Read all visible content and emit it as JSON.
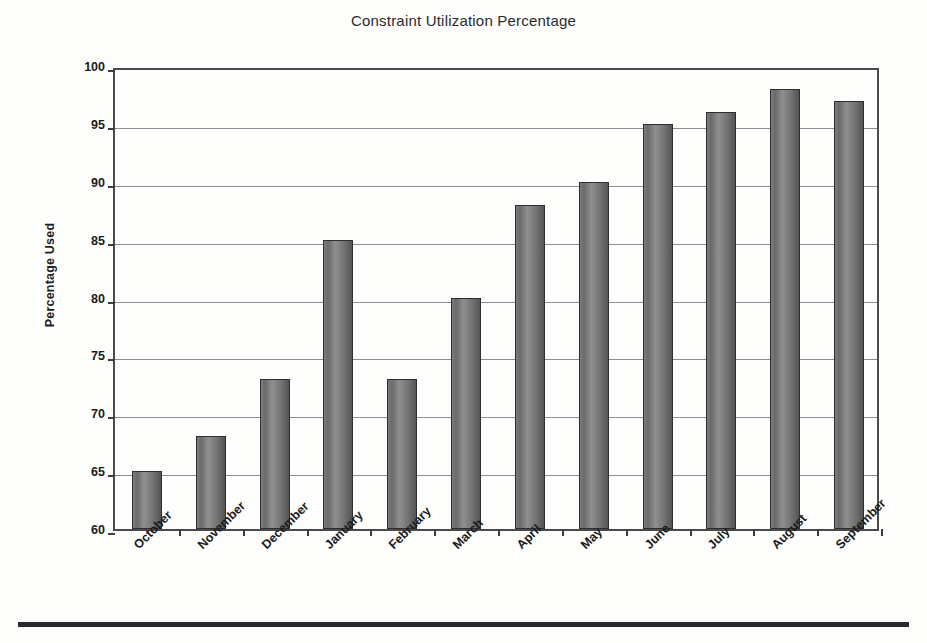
{
  "chart_data": {
    "type": "bar",
    "title": "Constraint Utilization Percentage",
    "xlabel": "",
    "ylabel": "Percentage Used",
    "categories": [
      "October",
      "November",
      "December",
      "January",
      "February",
      "March",
      "April",
      "May",
      "June",
      "July",
      "August",
      "September"
    ],
    "values": [
      65,
      68,
      73,
      85,
      73,
      80,
      88,
      90,
      95,
      96,
      98,
      97
    ],
    "ylim": [
      60,
      100
    ],
    "yticks": [
      60,
      65,
      70,
      75,
      80,
      85,
      90,
      95,
      100
    ],
    "ytick_labels": [
      "60",
      "65",
      "70",
      "75",
      "80",
      "85",
      "90",
      "95",
      "100"
    ],
    "grid": true,
    "legend": false,
    "legend_position": "none",
    "series": [
      {
        "name": "Percentage Used",
        "values": [
          65,
          68,
          73,
          85,
          73,
          80,
          88,
          90,
          95,
          96,
          98,
          97
        ]
      }
    ],
    "colors": {
      "bar_fill_light": "#8f8f8f",
      "bar_fill_dark": "#545454",
      "bar_outline": "#2e2e2e",
      "gridline": "#8d8d8d",
      "axis": "#4a4a4a",
      "text": "#1b1b1b",
      "background": "#fdfdfc"
    }
  }
}
